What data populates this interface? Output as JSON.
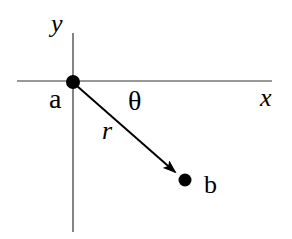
{
  "diagram": {
    "axes": {
      "x_label": "x",
      "y_label": "y"
    },
    "points": [
      {
        "id": "a",
        "label": "a"
      },
      {
        "id": "b",
        "label": "b"
      }
    ],
    "vector": {
      "label": "r",
      "from": "a",
      "to": "b"
    },
    "angle": {
      "label": "θ"
    },
    "colors": {
      "ink": "#000000",
      "axis": "#333333",
      "background": "#ffffff"
    }
  }
}
